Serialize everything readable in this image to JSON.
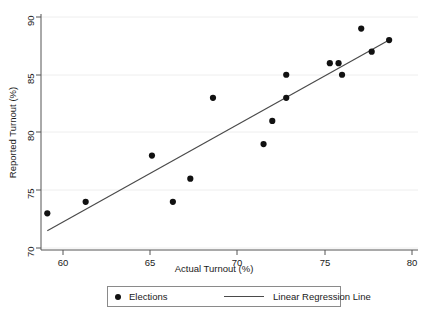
{
  "chart_data": {
    "type": "scatter",
    "title": "",
    "xlabel": "Actual Turnout (%)",
    "ylabel": "Reported Turnout (%)",
    "xlim": [
      58.6,
      80.3
    ],
    "ylim": [
      69.6,
      90.4
    ],
    "xticks": [
      60,
      65,
      70,
      75,
      80
    ],
    "yticks": [
      70,
      75,
      80,
      85,
      90
    ],
    "xtick_labels": [
      "60",
      "65",
      "70",
      "75",
      "80"
    ],
    "ytick_labels": [
      "70",
      "75",
      "80",
      "85",
      "90"
    ],
    "grid": "horizontal",
    "grid_color": "#e8e8e8",
    "point_color": "#111111",
    "line_color": "#4a4a4a",
    "legend_position": "below-axes",
    "series": [
      {
        "name": "Elections",
        "type": "scatter",
        "points": [
          {
            "x": 59.1,
            "y": 73.0
          },
          {
            "x": 61.3,
            "y": 74.0
          },
          {
            "x": 65.1,
            "y": 78.0
          },
          {
            "x": 66.3,
            "y": 74.0
          },
          {
            "x": 67.3,
            "y": 76.0
          },
          {
            "x": 68.6,
            "y": 83.0
          },
          {
            "x": 71.5,
            "y": 79.0
          },
          {
            "x": 72.0,
            "y": 81.0
          },
          {
            "x": 72.8,
            "y": 83.0
          },
          {
            "x": 72.8,
            "y": 85.0
          },
          {
            "x": 75.3,
            "y": 86.0
          },
          {
            "x": 75.8,
            "y": 86.0
          },
          {
            "x": 76.0,
            "y": 85.0
          },
          {
            "x": 77.1,
            "y": 89.0
          },
          {
            "x": 77.7,
            "y": 87.0
          },
          {
            "x": 78.7,
            "y": 88.0
          }
        ]
      },
      {
        "name": "Linear Regression Line",
        "type": "line",
        "endpoints": [
          {
            "x": 59.1,
            "y": 71.5
          },
          {
            "x": 78.7,
            "y": 88.0
          }
        ]
      }
    ]
  },
  "legend": {
    "entries": [
      {
        "label": "Elections",
        "marker": "dot"
      },
      {
        "label": "Linear Regression Line",
        "marker": "line"
      }
    ]
  }
}
